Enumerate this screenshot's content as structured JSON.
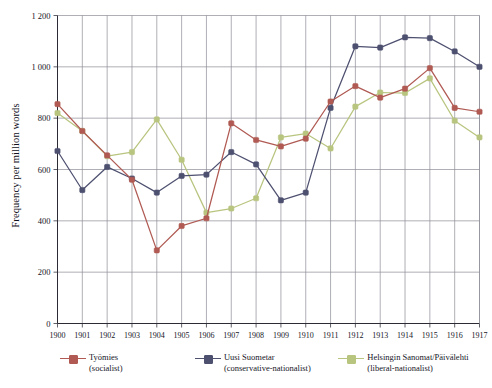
{
  "chart_data": {
    "type": "line",
    "title": "",
    "xlabel": "",
    "ylabel": "Frequency per million words",
    "x": [
      1900,
      1901,
      1902,
      1903,
      1904,
      1905,
      1906,
      1907,
      1908,
      1909,
      1910,
      1911,
      1912,
      1913,
      1914,
      1915,
      1916,
      1917
    ],
    "xtick_labels": [
      "1900",
      "1901",
      "1902",
      "1903",
      "1904",
      "1905",
      "1906",
      "1907",
      "1908",
      "1909",
      "1910",
      "1911",
      "1912",
      "1913",
      "1914",
      "1915",
      "1916",
      "1917"
    ],
    "ylim": [
      0,
      1200
    ],
    "yticks": [
      0,
      200,
      400,
      600,
      800,
      1000,
      1200
    ],
    "ytick_labels": [
      "0",
      "200",
      "400",
      "600",
      "800",
      "1 000",
      "1 200"
    ],
    "grid": true,
    "legend_position": "below",
    "series": [
      {
        "name": "Työmies",
        "subtitle": "(socialist)",
        "color": "#b05a53",
        "values": [
          855,
          750,
          655,
          560,
          285,
          380,
          410,
          780,
          715,
          690,
          720,
          865,
          925,
          880,
          915,
          995,
          840,
          825
        ]
      },
      {
        "name": "Uusi Suometar",
        "subtitle": "(conservative-nationalist)",
        "color": "#4e5070",
        "values": [
          672,
          520,
          610,
          565,
          510,
          575,
          580,
          668,
          620,
          480,
          510,
          840,
          1080,
          1075,
          1115,
          1112,
          1060,
          1000
        ]
      },
      {
        "name": "Helsingin Sanomat/Päivälehti",
        "subtitle": "(liberal-nationalist)",
        "color": "#b8c57f",
        "values": [
          820,
          750,
          652,
          668,
          795,
          638,
          432,
          448,
          488,
          725,
          740,
          682,
          845,
          900,
          898,
          955,
          790,
          725
        ]
      }
    ]
  },
  "legend": {
    "items": [
      {
        "name": "Työmies",
        "subtitle": "(socialist)",
        "color": "#b05a53"
      },
      {
        "name": "Uusi Suometar",
        "subtitle": "(conservative-nationalist)",
        "color": "#4e5070"
      },
      {
        "name": "Helsingin Sanomat/Päivälehti",
        "subtitle": "(liberal-nationalist)",
        "color": "#b8c57f"
      }
    ]
  }
}
